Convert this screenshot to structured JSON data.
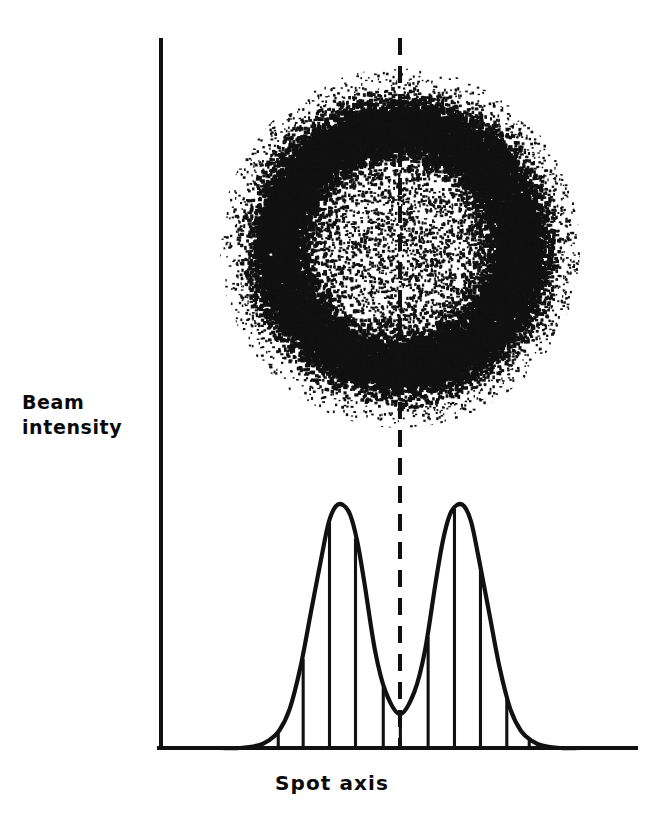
{
  "figure": {
    "y_axis_label": "Beam\nintensity",
    "x_axis_label": "Spot axis",
    "ink_color": "#111111",
    "background_color": "#ffffff"
  },
  "chart_data": {
    "type": "line",
    "title": "",
    "subtitle": "",
    "xlabel": "Spot axis",
    "ylabel": "Beam intensity",
    "grid": false,
    "legend": null,
    "annotations": [
      {
        "name": "beam-spot-image",
        "kind": "stippled-annular-spot",
        "description": "Dark stippled ring (annulus) with lighter core, fading outward",
        "center_x": 0.5,
        "ring_radius_px": 118,
        "cloud_radius_px": 175
      },
      {
        "name": "spot-center-axis",
        "kind": "dashed-vertical-line",
        "x": 0.5
      }
    ],
    "axis_ranges": {
      "xlim": [
        0,
        1
      ],
      "ylim": [
        0,
        1
      ]
    },
    "x_tick_labels": [],
    "y_tick_labels": [],
    "series": [
      {
        "name": "Beam intensity profile",
        "x": [
          0.0,
          0.05,
          0.1,
          0.13,
          0.16,
          0.19,
          0.22,
          0.25,
          0.28,
          0.3,
          0.32,
          0.34,
          0.36,
          0.38,
          0.4,
          0.43,
          0.46,
          0.5,
          0.54,
          0.57,
          0.6,
          0.62,
          0.64,
          0.66,
          0.68,
          0.7,
          0.72,
          0.75,
          0.78,
          0.81,
          0.84,
          0.87,
          0.9,
          0.95,
          1.0
        ],
        "y": [
          0.0,
          0.0,
          0.01,
          0.03,
          0.07,
          0.16,
          0.33,
          0.56,
          0.79,
          0.93,
          0.995,
          1.0,
          0.96,
          0.85,
          0.68,
          0.4,
          0.23,
          0.14,
          0.23,
          0.4,
          0.68,
          0.85,
          0.96,
          1.0,
          0.995,
          0.93,
          0.79,
          0.56,
          0.33,
          0.16,
          0.07,
          0.03,
          0.01,
          0.0,
          0.0
        ]
      }
    ],
    "ordinate_lines": {
      "description": "Vertical ordinate lines dropped from profile curve to baseline",
      "x": [
        0.158,
        0.228,
        0.302,
        0.375,
        0.453,
        0.501,
        0.579,
        0.653,
        0.726,
        0.8,
        0.863
      ]
    },
    "peaks": [
      {
        "name": "left-lobe-peak",
        "x": 0.302,
        "y": 1.0
      },
      {
        "name": "right-lobe-peak",
        "x": 0.726,
        "y": 1.0
      }
    ],
    "valley": {
      "name": "central-minimum",
      "x": 0.501,
      "y": 0.14
    }
  }
}
